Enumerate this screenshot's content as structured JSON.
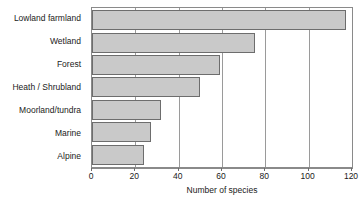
{
  "chart_data": {
    "type": "bar",
    "orientation": "horizontal",
    "title": "",
    "xlabel": "Number of species",
    "ylabel": "",
    "categories": [
      "Lowland farmland",
      "Wetland",
      "Forest",
      "Heath / Shrubland",
      "Moorland/tundra",
      "Marine",
      "Alpine"
    ],
    "values": [
      117,
      75,
      59,
      50,
      32,
      27,
      24
    ],
    "xlim": [
      0,
      120
    ],
    "xticks": [
      0,
      20,
      40,
      60,
      80,
      100,
      120
    ],
    "xtick_labels": [
      "0",
      "20",
      "40",
      "60",
      "80",
      "100",
      "120"
    ],
    "grid": "vertical",
    "legend": "none",
    "bar_fill_color": "#c9c9c9",
    "bar_edge_color": "#6d6d6d",
    "axis_color": "#8a8a8a",
    "gridline_color": "#9a9a9a",
    "background_color": "#ffffff"
  }
}
